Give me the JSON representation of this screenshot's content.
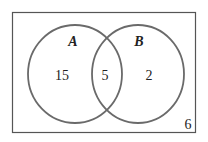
{
  "diagram": {
    "type": "venn",
    "universe": {
      "outside_value": "6"
    },
    "sets": [
      {
        "label": "A",
        "only_value": "15"
      },
      {
        "label": "B",
        "only_value": "2"
      }
    ],
    "intersection_value": "5",
    "colors": {
      "circle_stroke": "#6a6a6a",
      "rect_stroke": "#555555",
      "text": "#222222",
      "background": "#ffffff"
    }
  }
}
